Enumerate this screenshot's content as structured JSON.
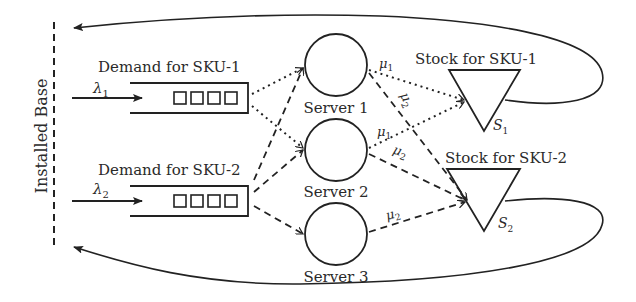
{
  "diagram": {
    "installed_base_label": "Installed Base",
    "demand": [
      {
        "label": "Demand for SKU-1",
        "rate": "λ",
        "rate_sub": "1"
      },
      {
        "label": "Demand for SKU-2",
        "rate": "λ",
        "rate_sub": "2"
      }
    ],
    "servers": [
      {
        "label": "Server 1"
      },
      {
        "label": "Server 2"
      },
      {
        "label": "Server 3"
      }
    ],
    "stocks": [
      {
        "label": "Stock for SKU-1",
        "level": "S",
        "level_sub": "1"
      },
      {
        "label": "Stock for SKU-2",
        "level": "S",
        "level_sub": "2"
      }
    ],
    "service_rates": [
      {
        "symbol": "μ",
        "sub": "1",
        "from": "Server 1",
        "to": "Stock for SKU-1"
      },
      {
        "symbol": "μ",
        "sub": "2",
        "from": "Server 1",
        "to": "Stock for SKU-2"
      },
      {
        "symbol": "μ",
        "sub": "1",
        "from": "Server 2",
        "to": "Stock for SKU-1"
      },
      {
        "symbol": "μ",
        "sub": "2",
        "from": "Server 2",
        "to": "Stock for SKU-2"
      },
      {
        "symbol": "μ",
        "sub": "2",
        "from": "Server 3",
        "to": "Stock for SKU-2"
      }
    ],
    "routing_edges": [
      {
        "from": "Demand for SKU-1",
        "to": "Server 1",
        "style": "dotted"
      },
      {
        "from": "Demand for SKU-1",
        "to": "Server 2",
        "style": "dotted"
      },
      {
        "from": "Demand for SKU-2",
        "to": "Server 1",
        "style": "dashed"
      },
      {
        "from": "Demand for SKU-2",
        "to": "Server 2",
        "style": "dashed"
      },
      {
        "from": "Demand for SKU-2",
        "to": "Server 3",
        "style": "dashed"
      }
    ],
    "queue_slots": 4
  }
}
